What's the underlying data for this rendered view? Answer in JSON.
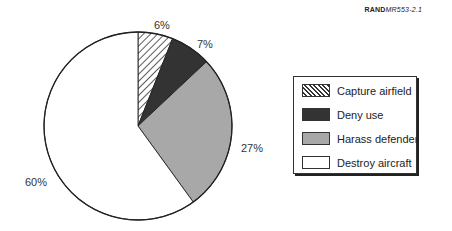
{
  "header": {
    "ref_bold": "RAND",
    "ref_italic": "MR553-2.1"
  },
  "chart_data": {
    "type": "pie",
    "title": "",
    "start_angle_deg": 0,
    "direction": "clockwise from 12 o'clock",
    "slices": [
      {
        "label": "Capture airfield",
        "value": 6,
        "display": "6%",
        "fill": "hatch",
        "color": "#ffffff"
      },
      {
        "label": "Deny use",
        "value": 7,
        "display": "7%",
        "fill": "solid",
        "color": "#333333"
      },
      {
        "label": "Harass defender",
        "value": 27,
        "display": "27%",
        "fill": "solid",
        "color": "#a8a8a8"
      },
      {
        "label": "Destroy aircraft",
        "value": 60,
        "display": "60%",
        "fill": "solid",
        "color": "#ffffff"
      }
    ],
    "legend_position": "right"
  },
  "legend": {
    "items": [
      {
        "label": "Capture airfield"
      },
      {
        "label": "Deny use"
      },
      {
        "label": "Harass defender"
      },
      {
        "label": "Destroy aircraft"
      }
    ]
  },
  "labels": {
    "capture": "6%",
    "deny": "7%",
    "harass": "27%",
    "destroy": "60%"
  }
}
